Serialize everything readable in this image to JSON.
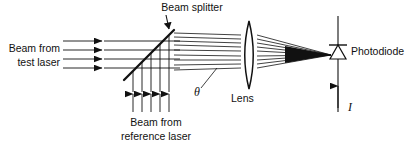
{
  "figure": {
    "background_color": "#ffffff",
    "stroke_color": "#111111",
    "width": 415,
    "height": 145
  },
  "labels": {
    "beam_splitter": "Beam splitter",
    "test_laser_line1": "Beam from",
    "test_laser_line2": "test laser",
    "reference_laser_line1": "Beam from",
    "reference_laser_line2": "reference laser",
    "theta": "θ",
    "lens": "Lens",
    "photodiode": "Photodiode",
    "current": "I"
  },
  "components": {
    "beam_splitter": {
      "name": "beam-splitter",
      "type": "diagonal-mirror",
      "x1": 124,
      "y1": 80,
      "x2": 174,
      "y2": 30,
      "angle_deg": 45
    },
    "lens": {
      "name": "lens",
      "type": "biconvex",
      "center_x": 249,
      "top_y": 21,
      "bottom_y": 89,
      "half_width": 8
    },
    "photodiode": {
      "name": "photodiode",
      "type": "diode-symbol",
      "wire_x": 338,
      "wire_top_y": 16,
      "wire_bottom_y": 112,
      "triangle_top_y": 45,
      "triangle_bottom_y": 59,
      "triangle_half_width": 8
    },
    "focal_point": {
      "x": 331,
      "y": 55
    }
  },
  "beams": {
    "test_laser": {
      "name": "test-laser-beam",
      "direction": "rightward-horizontal",
      "count": 4,
      "start_x": 63,
      "arrow_x": 104,
      "ray_ys": [
        41,
        50,
        59,
        68
      ]
    },
    "reference_laser": {
      "name": "reference-laser-beam",
      "direction": "upward-vertical",
      "count": 5,
      "bottom_y": 112,
      "arrow_y": 92,
      "ray_xs": [
        133,
        142,
        151,
        160,
        169
      ]
    },
    "combined": {
      "name": "combined-beam",
      "count": 9,
      "start_x": 174,
      "ray_start_ys": [
        33,
        37,
        41,
        45,
        50,
        55,
        60,
        65,
        70
      ],
      "lens_x": 241,
      "converge_x": 331,
      "converge_y": 55
    }
  },
  "annotations": {
    "beam_splitter_pointer": {
      "name": "beam-splitter-pointer",
      "from_x": 166,
      "from_y": 16,
      "to_x": 168,
      "to_y": 31
    },
    "theta_leader": {
      "name": "theta-leader-line",
      "from_x": 200,
      "from_y": 90,
      "to_x": 216,
      "to_y": 69
    },
    "current_arrow": {
      "name": "current-arrow",
      "x": 338,
      "from_y": 86,
      "to_y": 110
    }
  }
}
